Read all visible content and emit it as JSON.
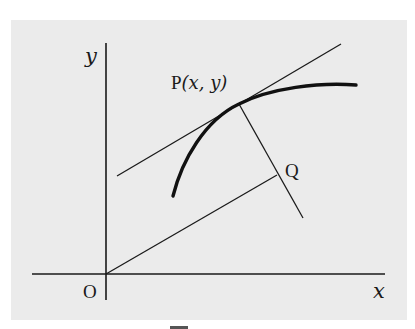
{
  "figure": {
    "background_color": "#ebebeb",
    "line_color": "#1a1a1a",
    "labels": {
      "y_axis": "y",
      "x_axis": "x",
      "origin": "O",
      "point_p_name": "P",
      "point_p_coords": "(x, y)",
      "point_q": "Q"
    },
    "elements": {
      "x_axis": {
        "from": [
          32,
          274
        ],
        "to": [
          385,
          274
        ]
      },
      "y_axis": {
        "from": [
          106,
          43
        ],
        "to": [
          106,
          300
        ]
      },
      "tangent_line": {
        "from": [
          117,
          176
        ],
        "to": [
          341,
          44
        ]
      },
      "normal_line": {
        "from": [
          239,
          104
        ],
        "to": [
          303,
          218
        ]
      },
      "segment_oq": {
        "from": [
          106,
          274
        ],
        "to": [
          277,
          175
        ]
      },
      "curve": {
        "from": [
          173,
          196
        ],
        "through": [
          239,
          104
        ],
        "to": [
          356,
          85
        ]
      }
    }
  }
}
